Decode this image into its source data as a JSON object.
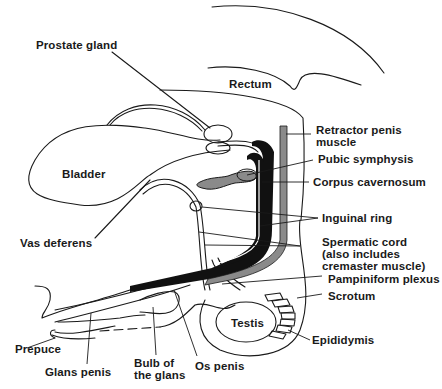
{
  "diagram": {
    "type": "anatomical-cross-section",
    "colors": {
      "line": "#1a1a1a",
      "black_fill": "#111111",
      "grey_fill": "#8a8a8a",
      "background": "#ffffff"
    },
    "labels": {
      "prostate_gland": "Prostate gland",
      "rectum": "Rectum",
      "bladder": "Bladder",
      "retractor_penis_muscle": "Retractor penis\nmuscle",
      "pubic_symphysis": "Pubic symphysis",
      "corpus_cavernosum": "Corpus cavernosum",
      "vas_deferens": "Vas deferens",
      "inguinal_ring": "Inguinal ring",
      "spermatic_cord": "Spermatic cord\n(also includes\ncremaster muscle)",
      "pampiniform_plexus": "Pampiniform plexus",
      "scrotum": "Scrotum",
      "testis": "Testis",
      "epididymis": "Epididymis",
      "prepuce": "Prepuce",
      "glans_penis": "Glans penis",
      "bulb_of_the_glans": "Bulb of\nthe glans",
      "os_penis": "Os penis"
    }
  }
}
